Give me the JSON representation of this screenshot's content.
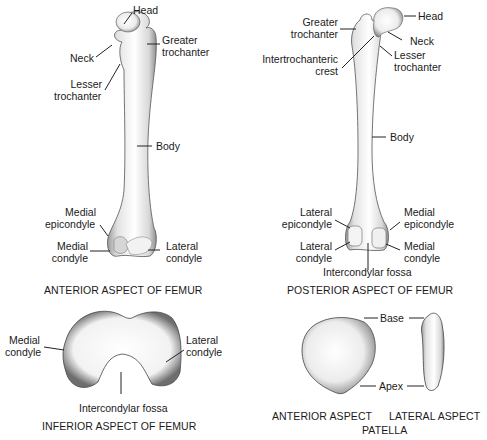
{
  "figure": {
    "panels": {
      "anterior_femur": {
        "caption": "ANTERIOR ASPECT OF FEMUR",
        "labels": {
          "head": "Head",
          "neck": "Neck",
          "greater_trochanter_1": "Greater",
          "greater_trochanter_2": "trochanter",
          "lesser_trochanter_1": "Lesser",
          "lesser_trochanter_2": "trochanter",
          "body": "Body",
          "medial_epicondyle_1": "Medial",
          "medial_epicondyle_2": "epicondyle",
          "medial_condyle_1": "Medial",
          "medial_condyle_2": "condyle",
          "lateral_condyle_1": "Lateral",
          "lateral_condyle_2": "condyle"
        }
      },
      "posterior_femur": {
        "caption": "POSTERIOR ASPECT OF FEMUR",
        "labels": {
          "head": "Head",
          "neck": "Neck",
          "greater_trochanter_1": "Greater",
          "greater_trochanter_2": "trochanter",
          "intertrochanteric_1": "Intertrochanteric",
          "intertrochanteric_2": "crest",
          "lesser_trochanter_1": "Lesser",
          "lesser_trochanter_2": "trochanter",
          "body": "Body",
          "lateral_epicondyle_1": "Lateral",
          "lateral_epicondyle_2": "epicondyle",
          "medial_epicondyle_1": "Medial",
          "medial_epicondyle_2": "epicondyle",
          "lateral_condyle_1": "Lateral",
          "lateral_condyle_2": "condyle",
          "medial_condyle_1": "Medial",
          "medial_condyle_2": "condyle",
          "intercondylar_fossa": "Intercondylar fossa"
        }
      },
      "inferior_femur": {
        "caption": "INFERIOR ASPECT OF FEMUR",
        "labels": {
          "medial_condyle_1": "Medial",
          "medial_condyle_2": "condyle",
          "lateral_condyle_1": "Lateral",
          "lateral_condyle_2": "condyle",
          "intercondylar_fossa": "Intercondylar fossa"
        }
      },
      "patella": {
        "caption_anterior": "ANTERIOR ASPECT",
        "caption_lateral": "LATERAL ASPECT",
        "caption_main": "PATELLA",
        "labels": {
          "base": "Base",
          "apex": "Apex"
        }
      }
    }
  }
}
